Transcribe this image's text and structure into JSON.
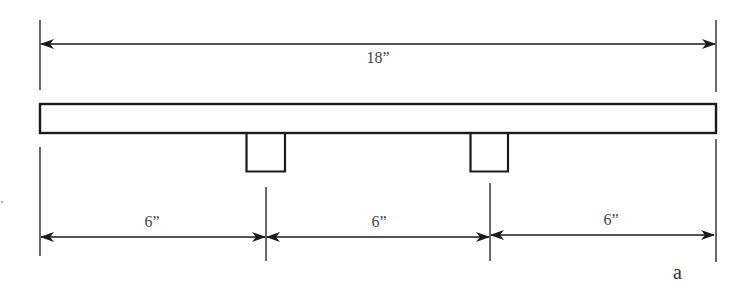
{
  "figure": {
    "label": "a",
    "colors": {
      "stroke": "#1a1a1a",
      "text": "#444444",
      "background": "#ffffff"
    }
  },
  "dimensions": {
    "overall": {
      "label": "18”",
      "value_in": 18
    },
    "segments": [
      {
        "label": "6”",
        "value_in": 6
      },
      {
        "label": "6”",
        "value_in": 6
      },
      {
        "label": "6”",
        "value_in": 6
      }
    ]
  },
  "beam": {
    "length_in": 18,
    "supports": [
      {
        "position_in": 6
      },
      {
        "position_in": 12
      }
    ]
  }
}
